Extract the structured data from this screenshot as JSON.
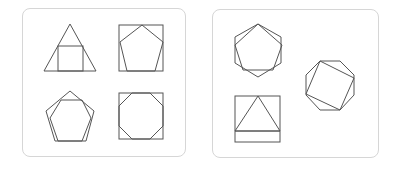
{
  "panels": [
    {
      "name": "left-panel",
      "figures": [
        "triangle-with-inscribed-square",
        "square-with-inscribed-pentagon",
        "pentagon-with-inscribed-hexagon",
        "square-with-inscribed-octagon"
      ]
    },
    {
      "name": "right-panel",
      "figures": [
        "hexagon-with-inscribed-pentagon",
        "octagon-with-inscribed-square",
        "square-with-inscribed-triangle"
      ]
    }
  ],
  "colors": {
    "stroke": "#555555",
    "panel_border": "#d6d6d6",
    "background": "#ffffff"
  }
}
